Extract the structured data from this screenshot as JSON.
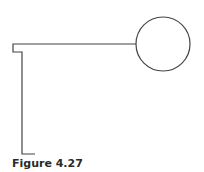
{
  "figure": {
    "caption": "Figure 4.27",
    "stroke_color": "#444444",
    "shapes": {
      "circle": {
        "cx": 163,
        "cy": 44,
        "r": 27
      },
      "path": "M 136 44 L 13 44 L 13 52 L 22 52 L 22 154 L 35 154"
    }
  }
}
